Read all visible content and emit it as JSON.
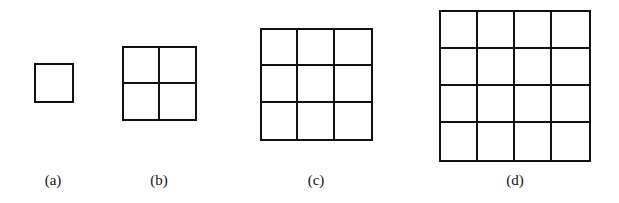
{
  "figure": {
    "stroke_color": "#111111",
    "background": "#ffffff",
    "panels": [
      {
        "label": "(a)",
        "n": 1,
        "x": 34,
        "y": 63,
        "size": 40,
        "label_x": 53,
        "label_y": 172
      },
      {
        "label": "(b)",
        "n": 2,
        "x": 122,
        "y": 46,
        "size": 75,
        "label_x": 159,
        "label_y": 172
      },
      {
        "label": "(c)",
        "n": 3,
        "x": 260,
        "y": 28,
        "size": 113,
        "label_x": 316,
        "label_y": 172
      },
      {
        "label": "(d)",
        "n": 4,
        "x": 439,
        "y": 10,
        "size": 152,
        "label_x": 515,
        "label_y": 172
      }
    ]
  }
}
